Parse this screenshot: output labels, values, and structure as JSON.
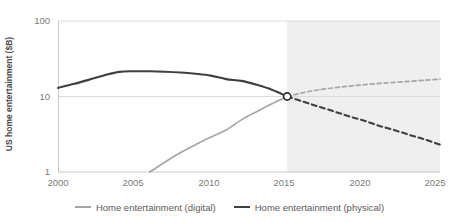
{
  "chart_data": {
    "type": "line",
    "title": "",
    "xlabel": "",
    "ylabel": "US home entertainment ($B)",
    "yscale": "log",
    "ylim": [
      1,
      100
    ],
    "xlim": [
      2000,
      2025
    ],
    "grid": true,
    "legend_position": "bottom",
    "yticks": [
      "100",
      "10",
      "1"
    ],
    "xticks": [
      "2000",
      "2005",
      "2010",
      "2015",
      "2020",
      "2025"
    ],
    "forecast_start": 2015,
    "forecast_shading": "#efefef",
    "crossover_point": {
      "x": 2015,
      "y": 10,
      "marker": "open-circle"
    },
    "series": [
      {
        "name": "Home entertainment (digital)",
        "color": "#a6a6a6",
        "actual_x": [
          2006,
          2007,
          2008,
          2009,
          2010,
          2011,
          2012,
          2013,
          2014,
          2015
        ],
        "actual_values": [
          1.0,
          1.35,
          1.8,
          2.3,
          2.9,
          3.6,
          4.9,
          6.3,
          8.0,
          10.0
        ],
        "forecast_x": [
          2015,
          2016,
          2017,
          2018,
          2019,
          2020,
          2021,
          2022,
          2023,
          2024,
          2025
        ],
        "forecast_values": [
          10.0,
          11.2,
          12.2,
          13.0,
          13.7,
          14.3,
          14.9,
          15.4,
          15.9,
          16.4,
          17.0
        ]
      },
      {
        "name": "Home entertainment (physical)",
        "color": "#3f3f3f",
        "actual_x": [
          2000,
          2001,
          2002,
          2003,
          2004,
          2005,
          2006,
          2007,
          2008,
          2009,
          2010,
          2011,
          2012,
          2013,
          2014,
          2015
        ],
        "actual_values": [
          13.0,
          14.6,
          16.6,
          19.0,
          21.2,
          21.6,
          21.6,
          21.3,
          20.8,
          20.0,
          18.9,
          17.0,
          16.1,
          14.3,
          12.3,
          10.0
        ],
        "forecast_x": [
          2015,
          2016,
          2017,
          2018,
          2019,
          2020,
          2021,
          2022,
          2023,
          2024,
          2025
        ],
        "forecast_values": [
          10.0,
          8.6,
          7.4,
          6.4,
          5.5,
          4.8,
          4.1,
          3.6,
          3.1,
          2.7,
          2.3
        ]
      }
    ]
  },
  "axis": {
    "y_title": "US home entertainment ($B)",
    "y_ticks": [
      {
        "label": "100",
        "value": 100
      },
      {
        "label": "10",
        "value": 10
      },
      {
        "label": "1",
        "value": 1
      }
    ],
    "x_ticks": [
      {
        "label": "2000",
        "value": 2000
      },
      {
        "label": "2005",
        "value": 2005
      },
      {
        "label": "2010",
        "value": 2010
      },
      {
        "label": "2015",
        "value": 2015
      },
      {
        "label": "2020",
        "value": 2020
      },
      {
        "label": "2025",
        "value": 2025
      }
    ]
  },
  "legend": {
    "items": [
      {
        "label": "Home entertainment (digital)",
        "color": "#a6a6a6"
      },
      {
        "label": "Home entertainment (physical)",
        "color": "#3f3f3f"
      }
    ]
  }
}
